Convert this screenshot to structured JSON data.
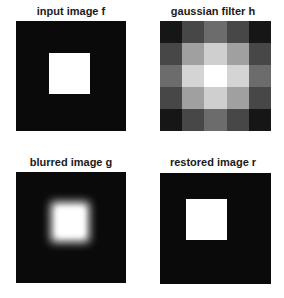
{
  "figure": {
    "panels": [
      {
        "id": "input",
        "title": "input image f",
        "type": "image",
        "description": "black background with centered white square"
      },
      {
        "id": "filter",
        "title": "gaussian filter h",
        "type": "image",
        "grid_size": 5,
        "gray_levels": [
          [
            "#161616",
            "#474747",
            "#6c6c6c",
            "#474747",
            "#161616"
          ],
          [
            "#474747",
            "#a0a0a0",
            "#cfcfcf",
            "#a0a0a0",
            "#474747"
          ],
          [
            "#6c6c6c",
            "#d4d4d4",
            "#ffffff",
            "#d4d4d4",
            "#6c6c6c"
          ],
          [
            "#474747",
            "#a0a0a0",
            "#cfcfcf",
            "#a0a0a0",
            "#474747"
          ],
          [
            "#161616",
            "#474747",
            "#6c6c6c",
            "#474747",
            "#161616"
          ]
        ]
      },
      {
        "id": "blurred",
        "title": "blurred image g",
        "type": "image",
        "description": "black background with blurred centered white square"
      },
      {
        "id": "restored",
        "title": "restored image r",
        "type": "image",
        "description": "black background with sharp centered white square"
      }
    ]
  }
}
